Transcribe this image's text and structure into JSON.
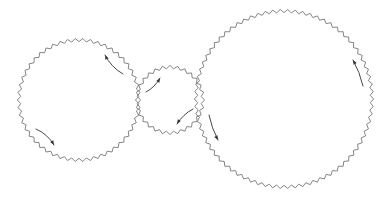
{
  "diagram": {
    "type": "gear-train",
    "width": 392,
    "height": 201,
    "background": "#ffffff",
    "gear_color": "#777777",
    "arrow_color": "#333333",
    "tooth_depth": 3.2,
    "gears": [
      {
        "id": "gear-left",
        "cx": 79,
        "cy": 100,
        "radius": 60,
        "teeth": 50,
        "rotation": "counter-clockwise",
        "arrows": [
          {
            "from": [
              123,
              74
            ],
            "to": [
              105,
              55
            ],
            "bend": -4
          },
          {
            "from": [
              36,
              129
            ],
            "to": [
              54,
              145
            ],
            "bend": -4
          }
        ]
      },
      {
        "id": "gear-middle",
        "cx": 170,
        "cy": 100,
        "radius": 33,
        "teeth": 28,
        "rotation": "clockwise",
        "arrows": [
          {
            "from": [
              146,
              92
            ],
            "to": [
              160,
              78
            ],
            "bend": 3
          },
          {
            "from": [
              193,
              109
            ],
            "to": [
              177,
              124
            ],
            "bend": 3
          }
        ]
      },
      {
        "id": "gear-right",
        "cx": 284,
        "cy": 99,
        "radius": 88,
        "teeth": 74,
        "rotation": "counter-clockwise",
        "arrows": [
          {
            "from": [
              209,
              115
            ],
            "to": [
              218,
              140
            ],
            "bend": 2
          },
          {
            "from": [
              363,
              86
            ],
            "to": [
              353,
              60
            ],
            "bend": 2
          }
        ]
      }
    ]
  }
}
